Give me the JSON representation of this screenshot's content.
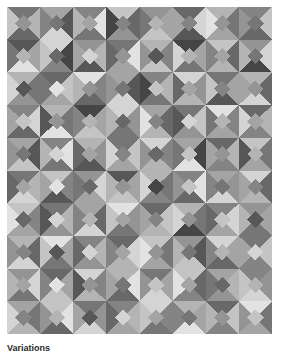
{
  "figure": {
    "caption": "Variations",
    "caption_clipped": true,
    "background_color": "#ffffff",
    "border_color": "#9a9a9a"
  },
  "chart_data": {
    "type": "heatmap",
    "subtitle": "",
    "xlabel": "",
    "ylabel": "",
    "grid": false,
    "legend_position": "none",
    "columns": 8,
    "rows": 10,
    "cell_width": 33.125,
    "cell_height": 32.7,
    "palette": {
      "k0": "#1c1c1c",
      "k1": "#2e2e2e",
      "k2": "#454545",
      "k3": "#575757",
      "k4": "#686868",
      "k5": "#767676",
      "k6": "#848484",
      "k7": "#949494",
      "k8": "#a4a4a4",
      "k9": "#b4b4b4",
      "k10": "#c4c4c4",
      "k11": "#d4d4d4",
      "k12": "#e2e2e2",
      "k13": "#efefef"
    },
    "motif": "square-in-square: four corner triangles plus a center diamond",
    "cells": [
      [
        [
          "k5",
          "k9",
          "k4",
          "k10",
          "k7"
        ],
        [
          "k8",
          "k3",
          "k11",
          "k6",
          "k5"
        ],
        [
          "k6",
          "k12",
          "k5",
          "k9",
          "k8"
        ],
        [
          "k10",
          "k4",
          "k7",
          "k2",
          "k6"
        ],
        [
          "k7",
          "k8",
          "k10",
          "k5",
          "k9"
        ],
        [
          "k4",
          "k11",
          "k3",
          "k8",
          "k6"
        ],
        [
          "k9",
          "k5",
          "k8",
          "k12",
          "k7"
        ],
        [
          "k6",
          "k10",
          "k4",
          "k7",
          "k5"
        ]
      ],
      [
        [
          "k3",
          "k8",
          "k12",
          "k5",
          "k9"
        ],
        [
          "k11",
          "k2",
          "k6",
          "k10",
          "k4"
        ],
        [
          "k7",
          "k9",
          "k3",
          "k8",
          "k11"
        ],
        [
          "k5",
          "k12",
          "k8",
          "k4",
          "k7"
        ],
        [
          "k9",
          "k6",
          "k10",
          "k7",
          "k3"
        ],
        [
          "k2",
          "k8",
          "k5",
          "k11",
          "k9"
        ],
        [
          "k10",
          "k4",
          "k9",
          "k6",
          "k8"
        ],
        [
          "k7",
          "k11",
          "k2",
          "k9",
          "k5"
        ]
      ],
      [
        [
          "k9",
          "k5",
          "k7",
          "k11",
          "k3"
        ],
        [
          "k4",
          "k10",
          "k8",
          "k5",
          "k12"
        ],
        [
          "k12",
          "k6",
          "k4",
          "k9",
          "k7"
        ],
        [
          "k8",
          "k3",
          "k11",
          "k7",
          "k5"
        ],
        [
          "k6",
          "k9",
          "k5",
          "k2",
          "k10"
        ],
        [
          "k11",
          "k7",
          "k9",
          "k4",
          "k8"
        ],
        [
          "k5",
          "k8",
          "k3",
          "k10",
          "k6"
        ],
        [
          "k9",
          "k4",
          "k11",
          "k8",
          "k7"
        ]
      ],
      [
        [
          "k6",
          "k11",
          "k4",
          "k8",
          "k10"
        ],
        [
          "k9",
          "k5",
          "k12",
          "k3",
          "k7"
        ],
        [
          "k2",
          "k8",
          "k10",
          "k6",
          "k9"
        ],
        [
          "k11",
          "k7",
          "k5",
          "k9",
          "k4"
        ],
        [
          "k8",
          "k4",
          "k9",
          "k12",
          "k6"
        ],
        [
          "k5",
          "k10",
          "k7",
          "k3",
          "k11"
        ],
        [
          "k12",
          "k6",
          "k8",
          "k5",
          "k9"
        ],
        [
          "k4",
          "k9",
          "k6",
          "k11",
          "k8"
        ]
      ],
      [
        [
          "k8",
          "k3",
          "k10",
          "k7",
          "k5"
        ],
        [
          "k6",
          "k12",
          "k5",
          "k9",
          "k11"
        ],
        [
          "k9",
          "k7",
          "k3",
          "k4",
          "k8"
        ],
        [
          "k5",
          "k10",
          "k8",
          "k11",
          "k6"
        ],
        [
          "k11",
          "k6",
          "k9",
          "k7",
          "k4"
        ],
        [
          "k8",
          "k2",
          "k12",
          "k5",
          "k10"
        ],
        [
          "k4",
          "k9",
          "k6",
          "k8",
          "k7"
        ],
        [
          "k10",
          "k5",
          "k8",
          "k3",
          "k9"
        ]
      ],
      [
        [
          "k5",
          "k9",
          "k11",
          "k4",
          "k8"
        ],
        [
          "k10",
          "k6",
          "k3",
          "k8",
          "k12"
        ],
        [
          "k7",
          "k11",
          "k8",
          "k5",
          "k4"
        ],
        [
          "k3",
          "k8",
          "k10",
          "k9",
          "k7"
        ],
        [
          "k9",
          "k5",
          "k6",
          "k11",
          "k2"
        ],
        [
          "k6",
          "k12",
          "k4",
          "k7",
          "k10"
        ],
        [
          "k8",
          "k7",
          "k11",
          "k6",
          "k5"
        ],
        [
          "k11",
          "k4",
          "k9",
          "k8",
          "k6"
        ]
      ],
      [
        [
          "k10",
          "k6",
          "k8",
          "k12",
          "k4"
        ],
        [
          "k5",
          "k9",
          "k7",
          "k3",
          "k11"
        ],
        [
          "k8",
          "k4",
          "k11",
          "k6",
          "k9"
        ],
        [
          "k12",
          "k7",
          "k5",
          "k10",
          "k8"
        ],
        [
          "k4",
          "k10",
          "k9",
          "k8",
          "k6"
        ],
        [
          "k9",
          "k5",
          "k2",
          "k11",
          "k7"
        ],
        [
          "k6",
          "k11",
          "k8",
          "k4",
          "k10"
        ],
        [
          "k7",
          "k8",
          "k5",
          "k9",
          "k3"
        ]
      ],
      [
        [
          "k9",
          "k4",
          "k11",
          "k7",
          "k6"
        ],
        [
          "k12",
          "k8",
          "k5",
          "k10",
          "k3"
        ],
        [
          "k6",
          "k9",
          "k7",
          "k4",
          "k11"
        ],
        [
          "k4",
          "k11",
          "k9",
          "k6",
          "k8"
        ],
        [
          "k10",
          "k5",
          "k8",
          "k12",
          "k7"
        ],
        [
          "k7",
          "k3",
          "k10",
          "k9",
          "k5"
        ],
        [
          "k11",
          "k8",
          "k4",
          "k6",
          "k9"
        ],
        [
          "k5",
          "k10",
          "k6",
          "k8",
          "k11"
        ]
      ],
      [
        [
          "k7",
          "k11",
          "k5",
          "k9",
          "k8"
        ],
        [
          "k4",
          "k8",
          "k10",
          "k6",
          "k12"
        ],
        [
          "k11",
          "k6",
          "k9",
          "k3",
          "k7"
        ],
        [
          "k9",
          "k12",
          "k4",
          "k8",
          "k5"
        ],
        [
          "k5",
          "k8",
          "k11",
          "k7",
          "k10"
        ],
        [
          "k10",
          "k4",
          "k6",
          "k12",
          "k8"
        ],
        [
          "k8",
          "k9",
          "k7",
          "k5",
          "k4"
        ],
        [
          "k6",
          "k7",
          "k11",
          "k10",
          "k9"
        ]
      ],
      [
        [
          "k8",
          "k5",
          "k9",
          "k11",
          "k6"
        ],
        [
          "k10",
          "k12",
          "k4",
          "k7",
          "k9"
        ],
        [
          "k5",
          "k7",
          "k11",
          "k8",
          "k3"
        ],
        [
          "k6",
          "k9",
          "k8",
          "k4",
          "k11"
        ],
        [
          "k11",
          "k6",
          "k5",
          "k10",
          "k8"
        ],
        [
          "k9",
          "k8",
          "k12",
          "k6",
          "k5"
        ],
        [
          "k4",
          "k10",
          "k6",
          "k9",
          "k7"
        ],
        [
          "k12",
          "k5",
          "k8",
          "k7",
          "k10"
        ]
      ]
    ]
  }
}
